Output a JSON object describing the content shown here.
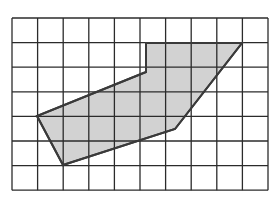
{
  "figure": {
    "width": 271,
    "height": 198,
    "background": "#ffffff",
    "grid": {
      "cols": 10,
      "rows": 7,
      "x0": 12,
      "y0": 18,
      "cell_w": 25.6,
      "cell_h": 24.6,
      "line_color": "#2b2b2b",
      "line_width": 1.3
    },
    "polygon": {
      "fill": "#d2d2d2",
      "stroke": "#3a3a3a",
      "stroke_width": 2,
      "points": [
        [
          37,
          116
        ],
        [
          63,
          165
        ],
        [
          175,
          129
        ],
        [
          242,
          43
        ],
        [
          146,
          43
        ],
        [
          146,
          72
        ]
      ]
    }
  }
}
